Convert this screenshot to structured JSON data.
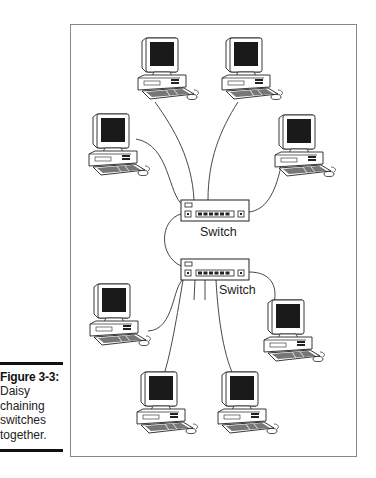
{
  "caption": {
    "figure_label": "Figure 3-3:",
    "lines": [
      "Daisy",
      "chaining",
      "switches",
      "together."
    ]
  },
  "diagram": {
    "switches": [
      {
        "id": "switch-1",
        "label": "Switch"
      },
      {
        "id": "switch-2",
        "label": "Switch"
      }
    ],
    "computers": [
      {
        "id": "pc-top-left",
        "connected_to": "switch-1"
      },
      {
        "id": "pc-top-right",
        "connected_to": "switch-1"
      },
      {
        "id": "pc-mid-left",
        "connected_to": "switch-1"
      },
      {
        "id": "pc-mid-right",
        "connected_to": "switch-1"
      },
      {
        "id": "pc-lower-left",
        "connected_to": "switch-2"
      },
      {
        "id": "pc-lower-right",
        "connected_to": "switch-2"
      },
      {
        "id": "pc-bottom-left",
        "connected_to": "switch-2"
      },
      {
        "id": "pc-bottom-right",
        "connected_to": "switch-2"
      }
    ],
    "links": [
      {
        "from": "switch-1",
        "to": "switch-2",
        "type": "daisy-chain"
      }
    ]
  }
}
